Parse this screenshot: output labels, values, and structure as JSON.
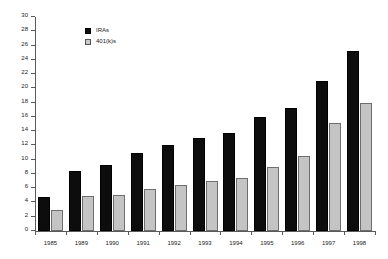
{
  "chart_data": {
    "type": "bar",
    "title": "",
    "subtitle": "",
    "xlabel": "",
    "ylabel": "",
    "ylim": [
      0,
      30
    ],
    "ytick_step": 2,
    "ytick_labels": [
      "0",
      "2",
      "4",
      "6",
      "8",
      "10",
      "12",
      "14",
      "16",
      "18",
      "20",
      "22",
      "24",
      "26",
      "28",
      "30"
    ],
    "grid": false,
    "legend_position": "top-center-left",
    "categories": [
      "1985",
      "1989",
      "1990",
      "1991",
      "1992",
      "1993",
      "1994",
      "1995",
      "1996",
      "1997",
      "1998"
    ],
    "series": [
      {
        "name": "IRAs",
        "color": "#0d0d0d",
        "values": [
          4.7,
          8.4,
          9.2,
          11.0,
          12.1,
          13.0,
          13.8,
          16.0,
          17.2,
          21.0,
          25.3
        ]
      },
      {
        "name": "401(k)s",
        "color": "#c4c4c4",
        "values": [
          2.9,
          4.9,
          5.1,
          5.9,
          6.4,
          7.0,
          7.5,
          9.0,
          10.5,
          15.2,
          17.9
        ]
      }
    ],
    "annotations": []
  },
  "legend": {
    "items": [
      {
        "label": "IRAs",
        "swatch": "legend-swatch-black"
      },
      {
        "label": "401(k)s",
        "swatch": "legend-swatch-gray"
      }
    ]
  },
  "axes": {
    "y": {
      "min": 0,
      "max": 30,
      "step": 2
    },
    "x": {
      "label": ""
    }
  }
}
